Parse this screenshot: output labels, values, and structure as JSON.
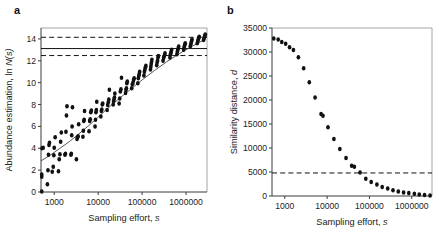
{
  "figure": {
    "panels": [
      {
        "letter": "a",
        "xlabel_main": "Sampling effort,",
        "xlabel_italic": "s",
        "ylabel_main": "Abundance estimation, ln",
        "ylabel_italic": "N(s)"
      },
      {
        "letter": "b",
        "xlabel_main": "Sampling effort,",
        "xlabel_italic": "s",
        "ylabel_main": "Similarity distance,",
        "ylabel_italic": "d"
      }
    ]
  },
  "chart_data": [
    {
      "type": "scatter",
      "panel": "a",
      "title": "",
      "xlabel": "Sampling effort, s",
      "ylabel": "Abundance estimation, ln N(s)",
      "xscale": "log",
      "xlim": [
        500,
        3000000
      ],
      "ylim": [
        0,
        15
      ],
      "yticks": [
        0,
        2,
        4,
        6,
        8,
        10,
        12,
        14
      ],
      "ytick_labels": [
        "0",
        "2",
        "4",
        "6",
        "8",
        "10",
        "12",
        "14"
      ],
      "xticks": [
        1000,
        10000,
        100000,
        1000000
      ],
      "xtick_labels": [
        "1000",
        "10000",
        "100000",
        "1000000"
      ],
      "grid": false,
      "legend": "none",
      "marker_color": "#111111",
      "reference_lines": [
        {
          "y": 14.15,
          "style": "dashed",
          "label": "upper confidence bound"
        },
        {
          "y": 13.12,
          "style": "solid",
          "label": "true abundance"
        },
        {
          "y": 12.48,
          "style": "dashed",
          "label": "lower confidence bound"
        }
      ],
      "fit_curve": {
        "style": "solid",
        "x": [
          500,
          800,
          1300,
          2200,
          3600,
          6000,
          10000,
          17000,
          30000,
          55000,
          100000,
          190000,
          360000,
          700000,
          1400000,
          2800000
        ],
        "y": [
          2.85,
          3.35,
          3.95,
          4.6,
          5.3,
          6.05,
          6.85,
          7.7,
          8.55,
          9.4,
          10.25,
          11.1,
          11.9,
          12.65,
          13.35,
          14.0
        ]
      },
      "points": [
        {
          "x": 520,
          "y": 0.05
        },
        {
          "x": 520,
          "y": 1.4
        },
        {
          "x": 520,
          "y": 1.6
        },
        {
          "x": 530,
          "y": 4.0
        },
        {
          "x": 560,
          "y": 4.05
        },
        {
          "x": 700,
          "y": 0.7
        },
        {
          "x": 720,
          "y": 2.0
        },
        {
          "x": 740,
          "y": 3.4
        },
        {
          "x": 760,
          "y": 4.3
        },
        {
          "x": 780,
          "y": 4.5
        },
        {
          "x": 900,
          "y": 1.85
        },
        {
          "x": 950,
          "y": 2.3
        },
        {
          "x": 980,
          "y": 3.35
        },
        {
          "x": 1000,
          "y": 4.05
        },
        {
          "x": 1050,
          "y": 5.0
        },
        {
          "x": 1250,
          "y": 1.9
        },
        {
          "x": 1300,
          "y": 3.0
        },
        {
          "x": 1350,
          "y": 3.45
        },
        {
          "x": 1400,
          "y": 4.6
        },
        {
          "x": 1450,
          "y": 5.45
        },
        {
          "x": 1750,
          "y": 3.4
        },
        {
          "x": 1800,
          "y": 3.5
        },
        {
          "x": 1850,
          "y": 5.5
        },
        {
          "x": 1900,
          "y": 7.0
        },
        {
          "x": 1950,
          "y": 7.85
        },
        {
          "x": 2400,
          "y": 3.4
        },
        {
          "x": 2450,
          "y": 3.5
        },
        {
          "x": 2500,
          "y": 5.2
        },
        {
          "x": 2550,
          "y": 6.0
        },
        {
          "x": 2600,
          "y": 7.75
        },
        {
          "x": 3200,
          "y": 3.0
        },
        {
          "x": 3300,
          "y": 4.85
        },
        {
          "x": 3400,
          "y": 5.0
        },
        {
          "x": 3500,
          "y": 5.1
        },
        {
          "x": 3600,
          "y": 6.2
        },
        {
          "x": 4500,
          "y": 5.05
        },
        {
          "x": 4600,
          "y": 5.6
        },
        {
          "x": 4700,
          "y": 6.5
        },
        {
          "x": 4800,
          "y": 6.6
        },
        {
          "x": 4900,
          "y": 7.4
        },
        {
          "x": 6200,
          "y": 5.55
        },
        {
          "x": 6400,
          "y": 6.5
        },
        {
          "x": 6600,
          "y": 6.65
        },
        {
          "x": 6800,
          "y": 7.3
        },
        {
          "x": 7000,
          "y": 7.45
        },
        {
          "x": 8500,
          "y": 6.0
        },
        {
          "x": 8700,
          "y": 6.6
        },
        {
          "x": 8900,
          "y": 7.3
        },
        {
          "x": 9100,
          "y": 7.5
        },
        {
          "x": 9300,
          "y": 8.25
        },
        {
          "x": 11500,
          "y": 6.9
        },
        {
          "x": 11800,
          "y": 7.4
        },
        {
          "x": 12100,
          "y": 7.55
        },
        {
          "x": 12400,
          "y": 8.0
        },
        {
          "x": 12700,
          "y": 8.1
        },
        {
          "x": 16000,
          "y": 7.5
        },
        {
          "x": 16500,
          "y": 7.95
        },
        {
          "x": 17000,
          "y": 8.2
        },
        {
          "x": 17500,
          "y": 8.45
        },
        {
          "x": 18000,
          "y": 9.35
        },
        {
          "x": 22000,
          "y": 8.0
        },
        {
          "x": 22500,
          "y": 8.3
        },
        {
          "x": 23000,
          "y": 8.5
        },
        {
          "x": 23500,
          "y": 8.65
        },
        {
          "x": 24000,
          "y": 9.0
        },
        {
          "x": 30000,
          "y": 8.1
        },
        {
          "x": 31000,
          "y": 8.55
        },
        {
          "x": 32000,
          "y": 9.2
        },
        {
          "x": 33000,
          "y": 9.4
        },
        {
          "x": 34000,
          "y": 10.45
        },
        {
          "x": 42000,
          "y": 9.05
        },
        {
          "x": 43000,
          "y": 9.35
        },
        {
          "x": 44000,
          "y": 9.5
        },
        {
          "x": 45000,
          "y": 9.95
        },
        {
          "x": 46000,
          "y": 10.1
        },
        {
          "x": 58000,
          "y": 9.5
        },
        {
          "x": 60000,
          "y": 9.85
        },
        {
          "x": 62000,
          "y": 10.0
        },
        {
          "x": 64000,
          "y": 10.25
        },
        {
          "x": 66000,
          "y": 10.4
        },
        {
          "x": 80000,
          "y": 9.95
        },
        {
          "x": 82000,
          "y": 10.4
        },
        {
          "x": 84000,
          "y": 10.6
        },
        {
          "x": 86000,
          "y": 10.8
        },
        {
          "x": 88000,
          "y": 11.0
        },
        {
          "x": 110000,
          "y": 10.65
        },
        {
          "x": 113000,
          "y": 11.0
        },
        {
          "x": 116000,
          "y": 11.2
        },
        {
          "x": 119000,
          "y": 11.4
        },
        {
          "x": 122000,
          "y": 11.55
        },
        {
          "x": 155000,
          "y": 11.2
        },
        {
          "x": 158000,
          "y": 11.45
        },
        {
          "x": 161000,
          "y": 11.7
        },
        {
          "x": 164000,
          "y": 11.9
        },
        {
          "x": 167000,
          "y": 12.1
        },
        {
          "x": 215000,
          "y": 11.6
        },
        {
          "x": 220000,
          "y": 11.85
        },
        {
          "x": 225000,
          "y": 12.0
        },
        {
          "x": 230000,
          "y": 12.3
        },
        {
          "x": 235000,
          "y": 12.45
        },
        {
          "x": 300000,
          "y": 12.0
        },
        {
          "x": 308000,
          "y": 12.25
        },
        {
          "x": 316000,
          "y": 12.4
        },
        {
          "x": 324000,
          "y": 12.5
        },
        {
          "x": 332000,
          "y": 12.7
        },
        {
          "x": 430000,
          "y": 12.3
        },
        {
          "x": 440000,
          "y": 12.55
        },
        {
          "x": 450000,
          "y": 12.7
        },
        {
          "x": 460000,
          "y": 12.85
        },
        {
          "x": 470000,
          "y": 13.0
        },
        {
          "x": 620000,
          "y": 12.6
        },
        {
          "x": 635000,
          "y": 12.85
        },
        {
          "x": 650000,
          "y": 13.0
        },
        {
          "x": 665000,
          "y": 13.15
        },
        {
          "x": 680000,
          "y": 13.3
        },
        {
          "x": 880000,
          "y": 13.0
        },
        {
          "x": 900000,
          "y": 13.2
        },
        {
          "x": 920000,
          "y": 13.35
        },
        {
          "x": 940000,
          "y": 13.5
        },
        {
          "x": 960000,
          "y": 13.6
        },
        {
          "x": 1250000,
          "y": 13.3
        },
        {
          "x": 1280000,
          "y": 13.5
        },
        {
          "x": 1310000,
          "y": 13.65
        },
        {
          "x": 1340000,
          "y": 13.8
        },
        {
          "x": 1370000,
          "y": 13.95
        },
        {
          "x": 1800000,
          "y": 13.6
        },
        {
          "x": 1850000,
          "y": 13.8
        },
        {
          "x": 1900000,
          "y": 13.95
        },
        {
          "x": 1950000,
          "y": 14.1
        },
        {
          "x": 2000000,
          "y": 14.2
        },
        {
          "x": 2500000,
          "y": 13.9
        },
        {
          "x": 2560000,
          "y": 14.05
        },
        {
          "x": 2620000,
          "y": 14.2
        },
        {
          "x": 2680000,
          "y": 14.3
        },
        {
          "x": 2740000,
          "y": 14.4
        }
      ]
    },
    {
      "type": "scatter",
      "panel": "b",
      "title": "",
      "xlabel": "Sampling effort, s",
      "ylabel": "Similarity distance, d",
      "xscale": "log",
      "xlim": [
        500,
        3000000
      ],
      "ylim": [
        0,
        35000
      ],
      "yticks": [
        0,
        5000,
        10000,
        15000,
        20000,
        25000,
        30000,
        35000
      ],
      "ytick_labels": [
        "0",
        "5000",
        "10000",
        "15000",
        "20000",
        "25000",
        "30000",
        "35000"
      ],
      "xticks": [
        1000,
        10000,
        100000,
        1000000
      ],
      "xtick_labels": [
        "1000",
        "10000",
        "100000",
        "1000000"
      ],
      "grid": false,
      "legend": "none",
      "marker_color": "#111111",
      "reference_lines": [
        {
          "y": 4800,
          "style": "dashed",
          "label": "similarity threshold"
        }
      ],
      "points": [
        {
          "x": 550,
          "y": 32800
        },
        {
          "x": 700,
          "y": 32600
        },
        {
          "x": 850,
          "y": 32100
        },
        {
          "x": 1050,
          "y": 31700
        },
        {
          "x": 1300,
          "y": 31000
        },
        {
          "x": 1600,
          "y": 30400
        },
        {
          "x": 2100,
          "y": 28900
        },
        {
          "x": 2800,
          "y": 26600
        },
        {
          "x": 3800,
          "y": 23700
        },
        {
          "x": 5200,
          "y": 20500
        },
        {
          "x": 7200,
          "y": 17100
        },
        {
          "x": 8000,
          "y": 16700
        },
        {
          "x": 10500,
          "y": 14300
        },
        {
          "x": 14500,
          "y": 11900
        },
        {
          "x": 20000,
          "y": 9800
        },
        {
          "x": 28000,
          "y": 7900
        },
        {
          "x": 38000,
          "y": 6300
        },
        {
          "x": 44000,
          "y": 6100
        },
        {
          "x": 60000,
          "y": 4900
        },
        {
          "x": 82000,
          "y": 3600
        },
        {
          "x": 110000,
          "y": 2900
        },
        {
          "x": 150000,
          "y": 2400
        },
        {
          "x": 200000,
          "y": 1900
        },
        {
          "x": 270000,
          "y": 1550
        },
        {
          "x": 360000,
          "y": 1200
        },
        {
          "x": 480000,
          "y": 950
        },
        {
          "x": 640000,
          "y": 750
        },
        {
          "x": 850000,
          "y": 600
        },
        {
          "x": 1150000,
          "y": 450
        },
        {
          "x": 1500000,
          "y": 330
        },
        {
          "x": 2000000,
          "y": 220
        },
        {
          "x": 2700000,
          "y": 120
        }
      ]
    }
  ]
}
